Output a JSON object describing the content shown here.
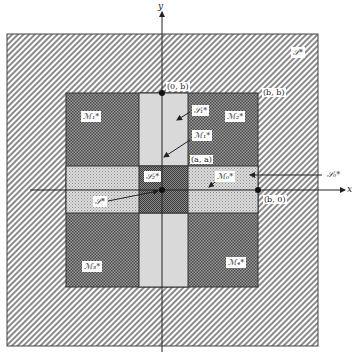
{
  "diagram": {
    "axes": {
      "x_label": "x",
      "y_label": "y"
    },
    "points": {
      "top": "(0, b)",
      "corner": "(b, b)",
      "center": "(a, a)",
      "right": "(b, 0)"
    },
    "regions": {
      "outer": "𝒮*",
      "quad_top_left": "ℳ₁*",
      "quad_top_right": "ℳ₂*",
      "quad_bottom_left": "ℳ₃*",
      "quad_bottom_right": "ℳ₄*",
      "vertical_band_upper": "𝒮₁*",
      "vertical_band_lower": "ℳ₁*",
      "horizontal_band_right": "ℳ₀*",
      "horizontal_band_right_arrow": "𝒮₀*",
      "center_square": "𝒮₂*",
      "center_arrow": "𝒮*"
    },
    "colors": {
      "line": "#222222",
      "hatch": "#777777",
      "light_band": "#d8d8d8"
    }
  }
}
